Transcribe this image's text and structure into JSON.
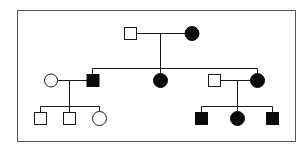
{
  "diagram": {
    "type": "pedigree",
    "colors": {
      "line": "#1a1a1a",
      "affected": "#0a0a0a",
      "unaffected": "#ffffff",
      "border": "#555555"
    },
    "generations": [
      {
        "label": "I",
        "individuals": [
          {
            "id": "I-1",
            "sex": "male",
            "affected": false
          },
          {
            "id": "I-2",
            "sex": "female",
            "affected": true
          }
        ]
      },
      {
        "label": "II",
        "individuals": [
          {
            "id": "II-spouse-1",
            "sex": "female",
            "affected": false
          },
          {
            "id": "II-1",
            "sex": "male",
            "affected": true
          },
          {
            "id": "II-2",
            "sex": "female",
            "affected": true
          },
          {
            "id": "II-spouse-2",
            "sex": "male",
            "affected": false
          },
          {
            "id": "II-3",
            "sex": "female",
            "affected": true
          }
        ]
      },
      {
        "label": "III",
        "individuals": [
          {
            "id": "III-1",
            "sex": "male",
            "affected": false
          },
          {
            "id": "III-2",
            "sex": "male",
            "affected": false
          },
          {
            "id": "III-3",
            "sex": "female",
            "affected": false
          },
          {
            "id": "III-4",
            "sex": "male",
            "affected": true
          },
          {
            "id": "III-5",
            "sex": "female",
            "affected": true
          },
          {
            "id": "III-6",
            "sex": "male",
            "affected": true
          }
        ]
      }
    ]
  }
}
